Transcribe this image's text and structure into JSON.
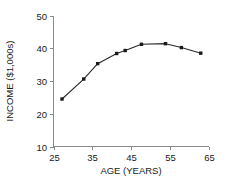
{
  "chart_data": {
    "type": "line",
    "title": "",
    "subtitle": "",
    "xlabel": "AGE (YEARS)",
    "ylabel": "INCOME ($1,000s)",
    "xlim": [
      25,
      65
    ],
    "ylim": [
      10,
      50
    ],
    "xticks": [
      25,
      35,
      45,
      55,
      65
    ],
    "xtick_labels": [
      "25",
      "35",
      "45",
      "55",
      "65"
    ],
    "yticks": [
      10,
      20,
      30,
      40,
      50
    ],
    "ytick_labels": [
      "10",
      "20",
      "30",
      "40",
      "50"
    ],
    "grid": false,
    "legend": false,
    "legend_position": "none",
    "marker": "filled-square",
    "line_color": "#2a2a2a",
    "marker_color": "#1a1a1a",
    "axis_color": "#8a8a8a",
    "background_color": "#ffffff",
    "series": [
      {
        "name": "income-by-age",
        "x": [
          27.2,
          32.8,
          36.4,
          41.3,
          43.5,
          47.7,
          53.9,
          58.0,
          63.0
        ],
        "y": [
          24.5,
          30.6,
          35.3,
          38.4,
          39.3,
          41.2,
          41.4,
          40.2,
          38.5
        ],
        "points": [
          {
            "age": 27.2,
            "income": 24.5
          },
          {
            "age": 32.8,
            "income": 30.6
          },
          {
            "age": 36.4,
            "income": 35.3
          },
          {
            "age": 41.3,
            "income": 38.4
          },
          {
            "age": 43.5,
            "income": 39.3
          },
          {
            "age": 47.7,
            "income": 41.2
          },
          {
            "age": 53.9,
            "income": 41.4
          },
          {
            "age": 58.0,
            "income": 40.2
          },
          {
            "age": 63.0,
            "income": 38.5
          }
        ]
      }
    ]
  }
}
